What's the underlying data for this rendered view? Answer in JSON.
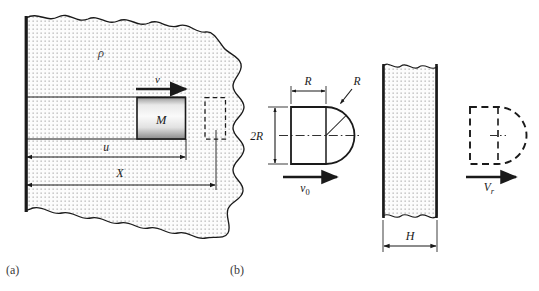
{
  "figure": {
    "type": "mechanics-schematic",
    "panels": [
      {
        "id": "a",
        "label": "(a)",
        "caption_label": "(a)",
        "elements": {
          "medium_density_symbol": "ρ",
          "mass_symbol": "M",
          "velocity_symbol": "v",
          "penetration_depth_symbol": "u",
          "total_distance_symbol": "X"
        }
      },
      {
        "id": "b",
        "label": "(b)",
        "caption_label": "(b)",
        "elements": {
          "nose_length_symbol": "R",
          "nose_radius_symbol": "R",
          "diameter_symbol": "2R",
          "impact_velocity_symbol": "v",
          "impact_velocity_subscript": "0",
          "plate_thickness_symbol": "H",
          "residual_velocity_symbol": "V",
          "residual_velocity_subscript": "r"
        }
      }
    ],
    "colors": {
      "line": "#1a1a1a",
      "stipple": "#7a7a7a",
      "fill": "#fbfbfb",
      "block_light": "#f2f2f2",
      "block_dark": "#8d8d8d",
      "label": "#3a3a3a"
    }
  }
}
